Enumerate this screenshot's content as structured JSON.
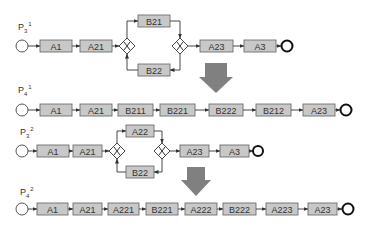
{
  "colors": {
    "task_fill": "#c8c8c8",
    "task_border": "#6e6e6e",
    "arrow_fill": "#808080",
    "line": "#333333"
  },
  "processes": [
    {
      "id": "p3_1",
      "label": "P",
      "sub": "3",
      "sup": "1",
      "pre_tasks": [
        "A1",
        "A21"
      ],
      "branch_top": "B21",
      "branch_bottom": "B22",
      "post_tasks": [
        "A23",
        "A3"
      ]
    },
    {
      "id": "p4_1",
      "label": "P",
      "sub": "4",
      "sup": "1",
      "tasks": [
        "A1",
        "A21",
        "B211",
        "B221",
        "B222",
        "B212",
        "A23"
      ]
    },
    {
      "id": "p3_2",
      "label": "P",
      "sub": "3",
      "sup": "2",
      "pre_tasks": [
        "A1",
        "A21"
      ],
      "branch_top": "A22",
      "branch_bottom": "B22",
      "post_tasks": [
        "A23",
        "A3"
      ]
    },
    {
      "id": "p4_2",
      "label": "P",
      "sub": "4",
      "sup": "2",
      "tasks": [
        "A1",
        "A21",
        "A221",
        "B221",
        "A222",
        "B222",
        "A223",
        "A23"
      ]
    }
  ],
  "transform_arrows": [
    "down-arrow-1",
    "down-arrow-2"
  ]
}
